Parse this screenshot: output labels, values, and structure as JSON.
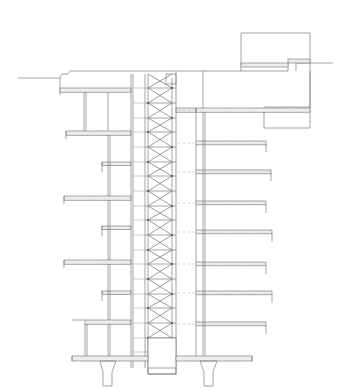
{
  "sheet": {
    "background_color": "#ffffff",
    "width": 343,
    "height": 389,
    "clipped_caption": "Figure. Typical building section"
  },
  "drawing": {
    "title": "Building Section",
    "type": "architectural-section",
    "line_colors": {
      "heavy": "#5a5a5a",
      "medium": "#7d7d7d",
      "light": "#a6a6a6",
      "hatch": "#b9b9b9",
      "slab_fill": "#ededed",
      "dashed": "#b0b0b0"
    },
    "stroke_widths": {
      "heavy": 0.9,
      "medium": 0.7,
      "light": 0.55
    },
    "labels": {
      "core": "braced-service-core",
      "left_wing": "left-bay-floors",
      "right_wing": "right-bay-floors",
      "penthouse": "roof-penthouse",
      "footing": "foundation-footings",
      "grade": "grade-line"
    },
    "geometry": {
      "core": {
        "x_left": 131,
        "x_right": 176,
        "brace_left": 148,
        "brace_right": 172,
        "y_top": 74,
        "y_bottom": 368,
        "panel_count": 20,
        "panel_height": 14.7
      },
      "left_wing": {
        "x_outer": 60,
        "x_inner": 131,
        "x_wall": 108
      },
      "right_wing": {
        "x_inner": 176,
        "x_outer": 266,
        "x_wall": 203
      },
      "floor_levels_left": [
        88,
        131,
        170,
        204,
        242,
        270,
        305,
        345
      ],
      "floor_levels_right": [
        108,
        141,
        170,
        203,
        231,
        263,
        291,
        322,
        345
      ],
      "penthouse": {
        "x1": 241,
        "y1": 33,
        "x2": 310,
        "y2": 107
      },
      "footing_y": 360,
      "grade_y": 74
    }
  }
}
